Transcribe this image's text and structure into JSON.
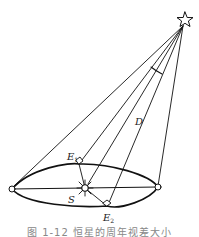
{
  "figure": {
    "labels": {
      "E1_main": "E",
      "E1_sub": "1",
      "E2_main": "E",
      "E2_sub": "2",
      "S": "S",
      "D": "D"
    },
    "caption": "图 1-12   恒星的周年视差大小",
    "colors": {
      "stroke": "#111111",
      "background": "#ffffff",
      "caption": "#888888"
    },
    "icons": {
      "star": "star-outline-icon",
      "sun": "sun-rays-icon"
    }
  }
}
